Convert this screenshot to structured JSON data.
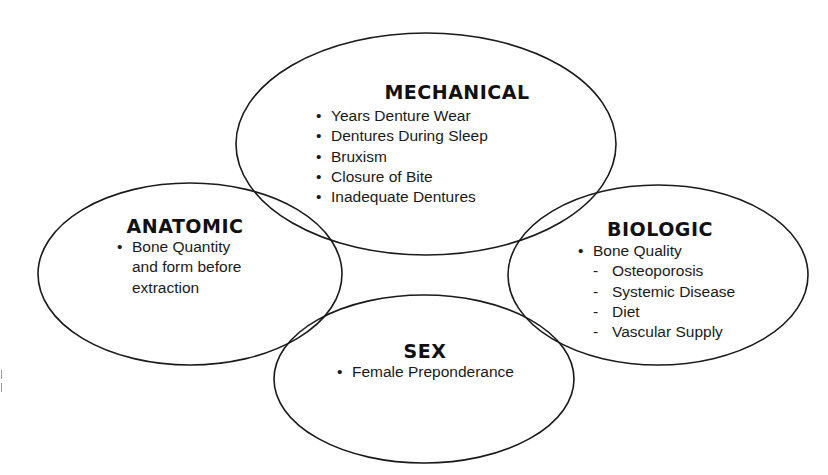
{
  "diagram": {
    "type": "overlapping-ellipses",
    "colors": {
      "stroke": "#1a1a1a",
      "text": "#111111",
      "background": "#ffffff"
    },
    "nodes": [
      {
        "id": "mechanical",
        "title": "MECHANICAL",
        "items": [
          {
            "marker": "•",
            "text": "Years Denture Wear"
          },
          {
            "marker": "•",
            "text": "Dentures During Sleep"
          },
          {
            "marker": "•",
            "text": "Bruxism"
          },
          {
            "marker": "•",
            "text": "Closure of Bite"
          },
          {
            "marker": "•",
            "text": "Inadequate Dentures"
          }
        ]
      },
      {
        "id": "anatomic",
        "title": "ANATOMIC",
        "items": [
          {
            "marker": "•",
            "text": "Bone Quantity"
          },
          {
            "marker": "",
            "text": "and form before"
          },
          {
            "marker": "",
            "text": "extraction"
          }
        ]
      },
      {
        "id": "biologic",
        "title": "BIOLOGIC",
        "items": [
          {
            "marker": "•",
            "text": "Bone Quality"
          },
          {
            "marker": "-",
            "text": "Osteoporosis"
          },
          {
            "marker": "-",
            "text": "Systemic Disease"
          },
          {
            "marker": "-",
            "text": "Diet"
          },
          {
            "marker": "-",
            "text": "Vascular Supply"
          }
        ]
      },
      {
        "id": "sex",
        "title": "SEX",
        "items": [
          {
            "marker": "•",
            "text": "Female Preponderance"
          }
        ]
      }
    ]
  }
}
